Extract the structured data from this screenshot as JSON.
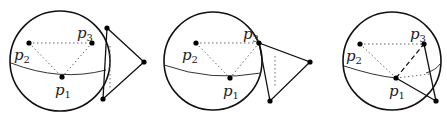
{
  "figure": {
    "panels": [
      {
        "id": "panel-1",
        "sphere": {
          "cx": 60,
          "cy": 61,
          "r": 50
        },
        "points": {
          "p1": {
            "x": 62,
            "y": 77,
            "label": "p",
            "sub": "1"
          },
          "p2": {
            "x": 29,
            "y": 43,
            "label": "p",
            "sub": "2"
          },
          "p3": {
            "x": 92,
            "y": 43,
            "label": "p",
            "sub": "3"
          }
        },
        "triangle": [
          [
            107,
            28
          ],
          [
            103,
            99
          ],
          [
            144,
            62
          ]
        ],
        "triangle_desc": "Triangle outside sphere, tangent on right side"
      },
      {
        "id": "panel-2",
        "sphere": {
          "cx": 213,
          "cy": 61,
          "r": 49
        },
        "points": {
          "p1": {
            "x": 230,
            "y": 78,
            "label": "p",
            "sub": "1"
          },
          "p2": {
            "x": 196,
            "y": 43,
            "label": "p",
            "sub": "2"
          },
          "p3": {
            "x": 259,
            "y": 43,
            "label": "p",
            "sub": "3"
          }
        },
        "triangle": [
          [
            259,
            43
          ],
          [
            270,
            101
          ],
          [
            310,
            62
          ]
        ],
        "triangle_desc": "Triangle with one vertex at p3"
      },
      {
        "id": "panel-3",
        "sphere": {
          "cx": 392,
          "cy": 61,
          "r": 49
        },
        "points": {
          "p1": {
            "x": 396,
            "y": 78,
            "label": "p",
            "sub": "1"
          },
          "p2": {
            "x": 360,
            "y": 44,
            "label": "p",
            "sub": "2"
          },
          "p3": {
            "x": 424,
            "y": 44,
            "label": "p",
            "sub": "3"
          }
        },
        "triangle": [
          [
            424,
            44
          ],
          [
            436,
            101
          ],
          [
            396,
            78
          ]
        ],
        "triangle_desc": "Triangle with vertices at p1 and p3"
      }
    ],
    "labels": {
      "p": "p",
      "s1": "1",
      "s2": "2",
      "s3": "3"
    }
  }
}
